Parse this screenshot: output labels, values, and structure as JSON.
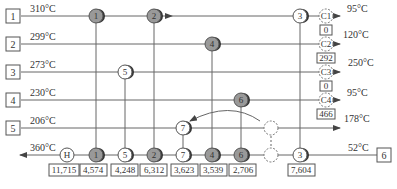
{
  "diagram": {
    "hot_streams": [
      {
        "id": "1",
        "inlet_temp": "310°C",
        "outlet_temp": "95°C"
      },
      {
        "id": "2",
        "inlet_temp": "299°C",
        "outlet_temp": "120°C"
      },
      {
        "id": "3",
        "inlet_temp": "273°C",
        "outlet_temp": "250°C"
      },
      {
        "id": "4",
        "inlet_temp": "230°C",
        "outlet_temp": "95°C"
      },
      {
        "id": "5",
        "inlet_temp": "206°C",
        "outlet_temp": "178°C"
      }
    ],
    "cold_stream": {
      "id": "6",
      "inlet_temp": "52°C",
      "outlet_temp": "360°C"
    },
    "coolers": [
      {
        "label": "C1",
        "duty": "0"
      },
      {
        "label": "C2",
        "duty": "292"
      },
      {
        "label": "C3",
        "duty": "0"
      },
      {
        "label": "C4",
        "duty": "466"
      }
    ],
    "exchangers_on_cold": [
      {
        "label": "H",
        "duty": "11,715"
      },
      {
        "label": "1",
        "duty": "4,574"
      },
      {
        "label": "5",
        "duty": "4,248"
      },
      {
        "label": "2",
        "duty": "6,312"
      },
      {
        "label": "7",
        "duty": "3,623"
      },
      {
        "label": "4",
        "duty": "3,539"
      },
      {
        "label": "6",
        "duty": "2,706"
      },
      {
        "label": "",
        "duty": ""
      },
      {
        "label": "3",
        "duty": "7,604"
      }
    ]
  }
}
